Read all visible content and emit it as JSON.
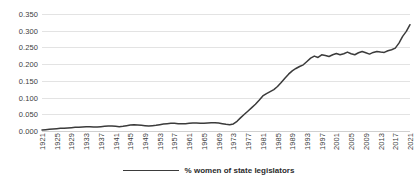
{
  "chart_data": {
    "type": "line",
    "title": "",
    "xlabel": "",
    "ylabel": "",
    "ylim": [
      0.0,
      0.35
    ],
    "ytick_labels": [
      "0.000",
      "0.050",
      "0.100",
      "0.150",
      "0.200",
      "0.250",
      "0.300",
      "0.350"
    ],
    "ytick_values": [
      0.0,
      0.05,
      0.1,
      0.15,
      0.2,
      0.25,
      0.3,
      0.35
    ],
    "xlim": [
      1921,
      2021
    ],
    "xtick_labels": [
      "1921",
      "1925",
      "1929",
      "1933",
      "1937",
      "1941",
      "1945",
      "1949",
      "1953",
      "1957",
      "1961",
      "1965",
      "1969",
      "1973",
      "1977",
      "1981",
      "1985",
      "1989",
      "1993",
      "1997",
      "2001",
      "2005",
      "2009",
      "2013",
      "2017",
      "2021"
    ],
    "grid": true,
    "legend_position": "bottom-center",
    "line_color": "#3b3b3b",
    "grid_color": "#e3e3e3",
    "series": [
      {
        "name": "% women of state legislators",
        "x": [
          1921,
          1922,
          1923,
          1924,
          1925,
          1926,
          1927,
          1928,
          1929,
          1930,
          1931,
          1932,
          1933,
          1934,
          1935,
          1936,
          1937,
          1938,
          1939,
          1940,
          1941,
          1942,
          1943,
          1944,
          1945,
          1946,
          1947,
          1948,
          1949,
          1950,
          1951,
          1952,
          1953,
          1954,
          1955,
          1956,
          1957,
          1958,
          1959,
          1960,
          1961,
          1962,
          1963,
          1964,
          1965,
          1966,
          1967,
          1968,
          1969,
          1970,
          1971,
          1972,
          1973,
          1974,
          1975,
          1976,
          1977,
          1978,
          1979,
          1980,
          1981,
          1982,
          1983,
          1984,
          1985,
          1986,
          1987,
          1988,
          1989,
          1990,
          1991,
          1992,
          1993,
          1994,
          1995,
          1996,
          1997,
          1998,
          1999,
          2000,
          2001,
          2002,
          2003,
          2004,
          2005,
          2006,
          2007,
          2008,
          2009,
          2010,
          2011,
          2012,
          2013,
          2014,
          2015,
          2016,
          2017,
          2018,
          2019,
          2020,
          2021
        ],
        "values": [
          0.003,
          0.004,
          0.005,
          0.006,
          0.007,
          0.008,
          0.008,
          0.009,
          0.01,
          0.011,
          0.011,
          0.012,
          0.013,
          0.013,
          0.012,
          0.012,
          0.013,
          0.014,
          0.015,
          0.015,
          0.014,
          0.013,
          0.014,
          0.016,
          0.018,
          0.019,
          0.018,
          0.017,
          0.016,
          0.015,
          0.016,
          0.017,
          0.019,
          0.021,
          0.022,
          0.023,
          0.023,
          0.022,
          0.022,
          0.022,
          0.023,
          0.024,
          0.024,
          0.023,
          0.023,
          0.024,
          0.025,
          0.025,
          0.024,
          0.022,
          0.02,
          0.019,
          0.021,
          0.029,
          0.04,
          0.05,
          0.06,
          0.07,
          0.08,
          0.092,
          0.105,
          0.112,
          0.118,
          0.124,
          0.133,
          0.145,
          0.158,
          0.17,
          0.18,
          0.187,
          0.193,
          0.198,
          0.208,
          0.218,
          0.224,
          0.22,
          0.228,
          0.226,
          0.223,
          0.228,
          0.232,
          0.228,
          0.231,
          0.236,
          0.231,
          0.228,
          0.234,
          0.238,
          0.234,
          0.23,
          0.235,
          0.238,
          0.236,
          0.235,
          0.24,
          0.243,
          0.248,
          0.263,
          0.283,
          0.298,
          0.318
        ]
      }
    ]
  },
  "legend": {
    "entries": [
      {
        "label": "% women of state legislators",
        "color": "#3b3b3b"
      }
    ]
  }
}
